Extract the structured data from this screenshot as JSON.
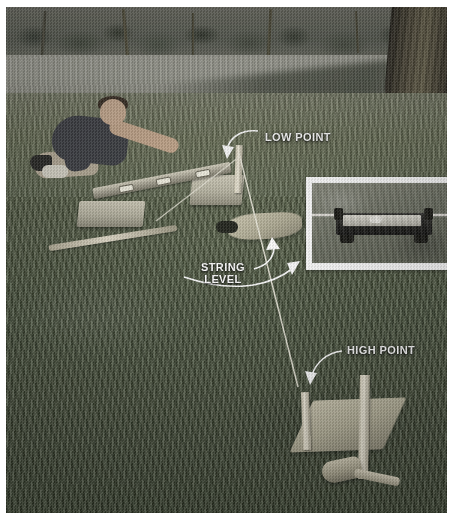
{
  "image": {
    "kind": "photograph",
    "subject": "Man using a long level on concrete blocks to set grade stakes in a lawn",
    "treatment": "desaturated color photo with white border"
  },
  "labels": [
    {
      "id": "low-point",
      "text": "LOW POINT",
      "color": "#ffffff"
    },
    {
      "id": "string-level",
      "text": "STRING\nLEVEL",
      "color": "#ffffff"
    },
    {
      "id": "high-point",
      "text": "HIGH POINT",
      "color": "#ffffff"
    }
  ],
  "annotations": {
    "arrow_color": "#ffffff",
    "arrow_count": 4,
    "string_color": "#e8e6d8"
  },
  "inset": {
    "caption": "",
    "subject": "close-up of a string level clipped onto a taut mason's line",
    "frame_color": "#ffffff"
  },
  "scene": {
    "background": "row of shrubs and trees with a large trunk at the right edge",
    "ground": "mown lawn, sunlit band behind the subject and shaded turf in front",
    "objects": [
      "kneeling man in dark shirt and light shorts",
      "long carpenter's level spanning two concrete blocks",
      "low-point grade stake",
      "two high-point grade stakes",
      "wooden mallet",
      "long stake lying in the grass",
      "mason's string running from low point to high point"
    ]
  },
  "colors": {
    "page_background": "#ffffff",
    "grass_light": "#7d826b",
    "grass_dark": "#3c4631",
    "stake": "#efeada",
    "block": "#cfcbb9"
  }
}
